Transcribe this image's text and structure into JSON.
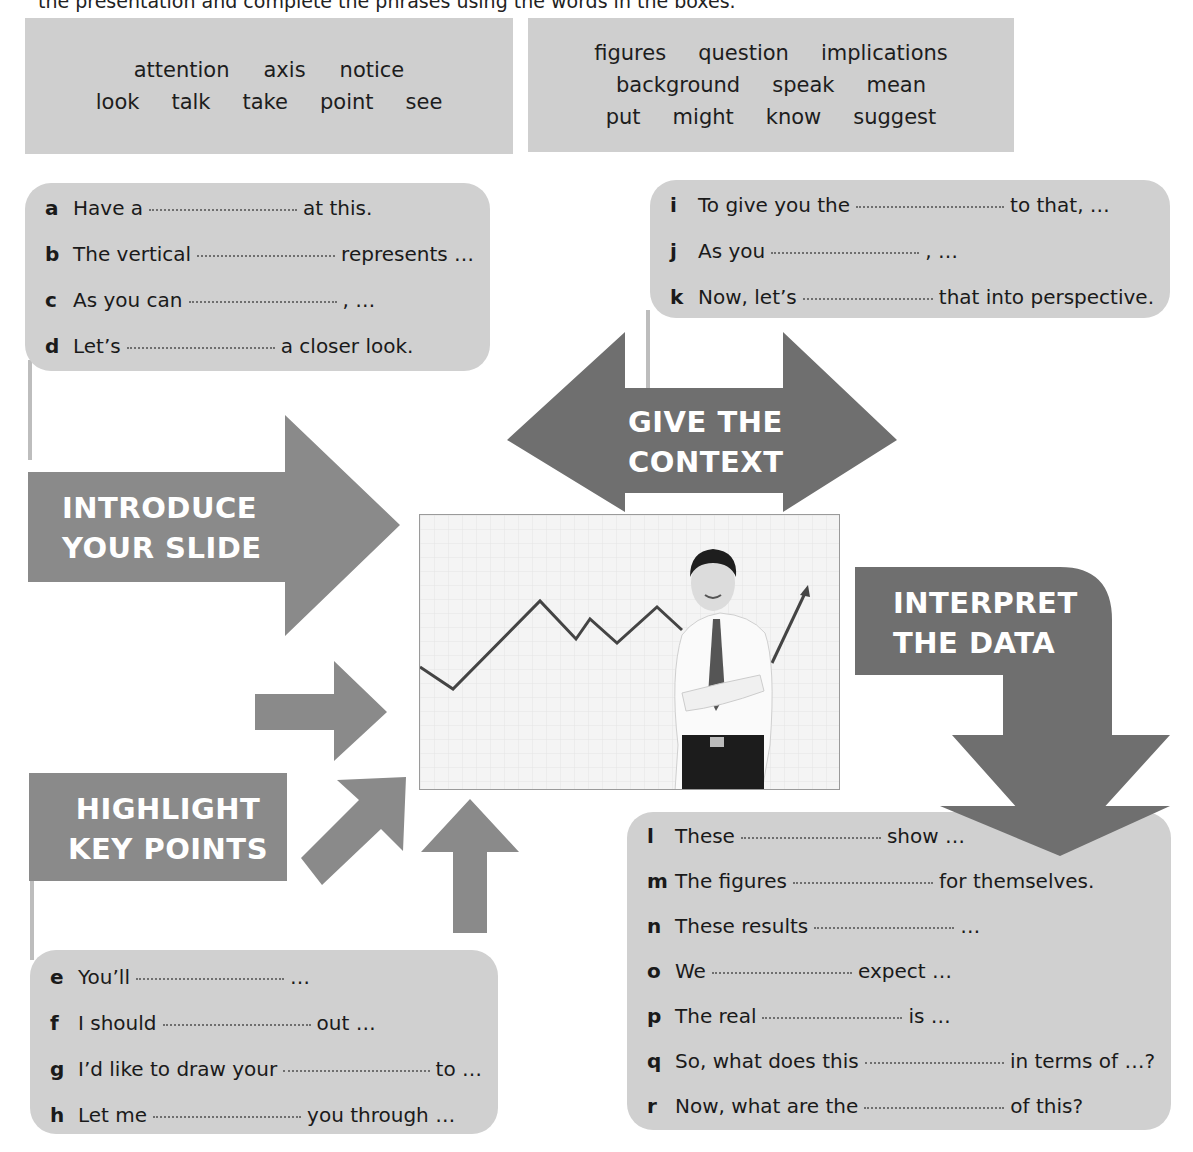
{
  "intro_line": "the presentation and complete the phrases using the words in the boxes.",
  "word_boxes": [
    {
      "rows": [
        [
          "attention",
          "axis",
          "notice"
        ],
        [
          "look",
          "talk",
          "take",
          "point",
          "see"
        ]
      ]
    },
    {
      "rows": [
        [
          "figures",
          "question",
          "implications"
        ],
        [
          "background",
          "speak",
          "mean"
        ],
        [
          "put",
          "might",
          "know",
          "suggest"
        ]
      ]
    }
  ],
  "stages": {
    "introduce": "INTRODUCE\nYOUR SLIDE",
    "introduce_lines": [
      "INTRODUCE",
      "YOUR SLIDE"
    ],
    "context_lines": [
      "GIVE THE",
      "CONTEXT"
    ],
    "interpret_lines": [
      "INTERPRET",
      "THE DATA"
    ],
    "highlight_lines": [
      "HIGHLIGHT",
      "KEY POINTS"
    ]
  },
  "phrase_groups": {
    "introduce": [
      {
        "letter": "a",
        "before": "Have a",
        "after": "at this."
      },
      {
        "letter": "b",
        "before": "The vertical",
        "after": "represents …"
      },
      {
        "letter": "c",
        "before": "As you can",
        "after": ", …"
      },
      {
        "letter": "d",
        "before": "Let’s",
        "after": "a closer look."
      }
    ],
    "context": [
      {
        "letter": "i",
        "before": "To give you the",
        "after": "to that, …"
      },
      {
        "letter": "j",
        "before": "As you",
        "after": ", …"
      },
      {
        "letter": "k",
        "before": "Now, let’s",
        "after": "that into perspective."
      }
    ],
    "highlight": [
      {
        "letter": "e",
        "before": "You’ll",
        "after": "…"
      },
      {
        "letter": "f",
        "before": "I should",
        "after": "out …"
      },
      {
        "letter": "g",
        "before": "I’d like to draw your",
        "after": "to …"
      },
      {
        "letter": "h",
        "before": "Let me",
        "after": "you through …"
      }
    ],
    "interpret": [
      {
        "letter": "l",
        "before": "These",
        "after": "show …"
      },
      {
        "letter": "m",
        "before": "The figures",
        "after": "for themselves."
      },
      {
        "letter": "n",
        "before": "These results",
        "after": "…"
      },
      {
        "letter": "o",
        "before": "We",
        "after": "expect …"
      },
      {
        "letter": "p",
        "before": "The real",
        "after": "is …"
      },
      {
        "letter": "q",
        "before": "So, what does this",
        "after": "in terms of …?"
      },
      {
        "letter": "r",
        "before": "Now, what are the",
        "after": "of this?"
      }
    ]
  },
  "photo": {
    "description": "smiling businessman with arms crossed in front of a rising zig-zag line graph"
  },
  "colors": {
    "arrow_gray": "#8a8a8a",
    "dark_arrow": "#6f6f6f",
    "box_gray": "#cfcfcf",
    "text": "#1a1a1a"
  }
}
